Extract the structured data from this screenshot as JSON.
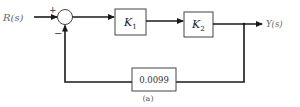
{
  "diagram": {
    "type": "feedback-control-block-diagram",
    "input_label": "R(s)",
    "output_label": "Y(s)",
    "summing_junction": {
      "plus_sign": "+",
      "minus_sign": "−"
    },
    "forward_blocks": [
      {
        "label_main": "K",
        "label_sub": "1"
      },
      {
        "label_main": "K",
        "label_sub": "2"
      }
    ],
    "feedback_block": {
      "label": "0.0099"
    },
    "caption": "(a)",
    "colors": {
      "line": "#1a1a1a",
      "box_stroke": "#333333",
      "label_text": "#666666"
    }
  }
}
